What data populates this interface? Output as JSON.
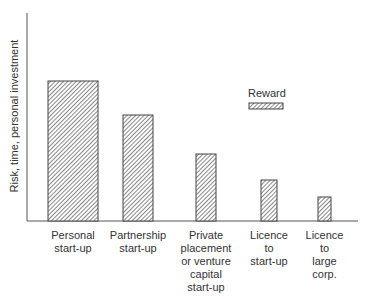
{
  "chart_data": {
    "type": "bar",
    "title": "",
    "xlabel": "",
    "ylabel": "Risk, time, personal investment",
    "categories": [
      "Personal start-up",
      "Partnership start-up",
      "Private placement or venture capital start-up",
      "Licence to start-up",
      "Licence to large corp."
    ],
    "series": [
      {
        "name": "Risk, time, personal investment (bar height)",
        "values": [
          100,
          74,
          47,
          29,
          17
        ]
      },
      {
        "name": "Reward (bar width)",
        "values": [
          50,
          30,
          20,
          16,
          13
        ]
      }
    ],
    "legend": {
      "entries": [
        "Reward"
      ],
      "position": "upper right"
    },
    "grid": false,
    "ylim": [
      0,
      150
    ]
  },
  "axis": {
    "ylabel": "Risk, time, personal investment"
  },
  "legend": {
    "label": "Reward"
  },
  "categories": [
    {
      "lines": [
        "Personal",
        "start-up"
      ]
    },
    {
      "lines": [
        "Partnership",
        "start-up"
      ]
    },
    {
      "lines": [
        "Private",
        "placement",
        "or venture",
        "capital",
        "start-up"
      ]
    },
    {
      "lines": [
        "Licence",
        "to",
        "start-up"
      ]
    },
    {
      "lines": [
        "Licence",
        "to",
        "large",
        "corp."
      ]
    }
  ],
  "bars": [
    {
      "x": 48,
      "width": 50,
      "top": 81
    },
    {
      "x": 123,
      "width": 30,
      "top": 115
    },
    {
      "x": 196,
      "width": 20,
      "top": 154
    },
    {
      "x": 261,
      "width": 16,
      "top": 180
    },
    {
      "x": 318,
      "width": 13,
      "top": 197
    }
  ],
  "colors": {
    "stroke": "#444444",
    "hatch": "#555555",
    "text": "#333333"
  }
}
